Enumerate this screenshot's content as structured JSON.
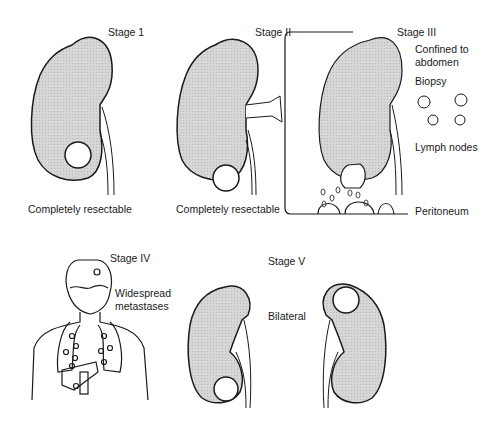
{
  "figure": {
    "colors": {
      "organ_fill": "#d4d4d4",
      "stroke": "#1a1a1a",
      "background": "#ffffff"
    },
    "stages": [
      {
        "id": "stage-1",
        "title": "Stage 1",
        "caption": "Completely resectable"
      },
      {
        "id": "stage-2",
        "title": "Stage II",
        "caption": "Completely resectable"
      },
      {
        "id": "stage-3",
        "title": "Stage III",
        "notes": [
          "Confined to",
          "abdomen",
          "Biopsy",
          "Lymph nodes",
          "Peritoneum"
        ]
      },
      {
        "id": "stage-4",
        "title": "Stage IV",
        "notes": [
          "Widespread",
          "metastases"
        ]
      },
      {
        "id": "stage-5",
        "title": "Stage V",
        "notes": [
          "Bilateral"
        ]
      }
    ]
  }
}
